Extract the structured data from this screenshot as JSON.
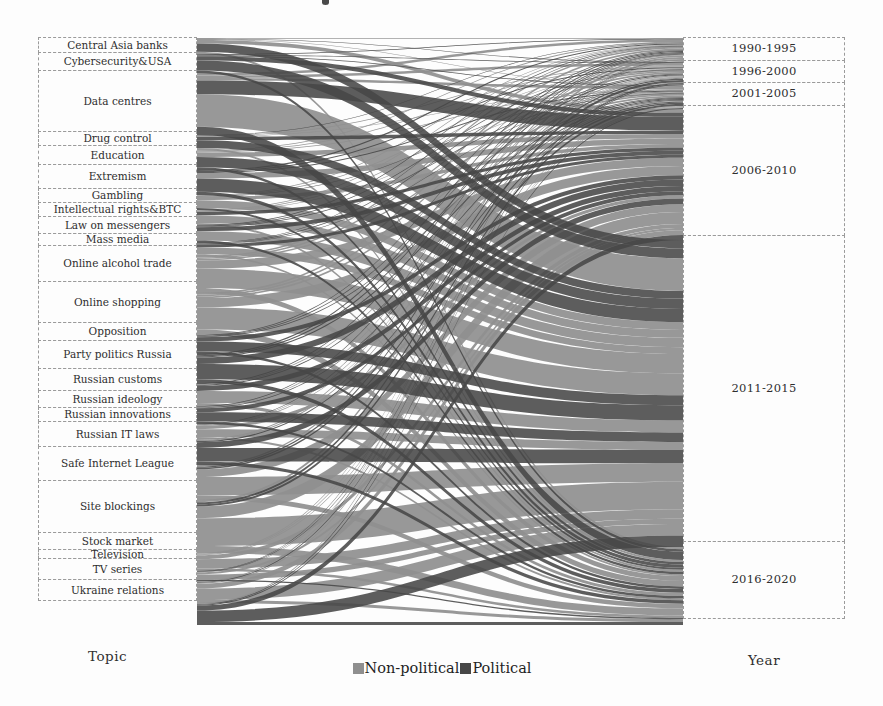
{
  "chart_data": {
    "type": "sankey",
    "left_axis_label": "Topic",
    "right_axis_label": "Year",
    "legend": [
      {
        "label": "Non-political",
        "color": "#8f8f8f"
      },
      {
        "label": "Political",
        "color": "#474747"
      }
    ],
    "left_nodes": [
      {
        "label": "Central Asia banks",
        "value": 16,
        "political_share": 0.35
      },
      {
        "label": "Cybersecurity&USA",
        "value": 19,
        "political_share": 0.7
      },
      {
        "label": "Data centres",
        "value": 62,
        "political_share": 0.25
      },
      {
        "label": "Drug control",
        "value": 15,
        "political_share": 0.5
      },
      {
        "label": "Education",
        "value": 20,
        "political_share": 0.2
      },
      {
        "label": "Extremism",
        "value": 25,
        "political_share": 0.8
      },
      {
        "label": "Gambling",
        "value": 15,
        "political_share": 0.4
      },
      {
        "label": "Intellectual rights&BTC",
        "value": 15,
        "political_share": 0.35
      },
      {
        "label": "Law on messengers",
        "value": 18,
        "political_share": 0.7
      },
      {
        "label": "Mass media",
        "value": 13,
        "political_share": 0.6
      },
      {
        "label": "Online alcohol trade",
        "value": 37,
        "political_share": 0.3
      },
      {
        "label": "Online shopping",
        "value": 42,
        "political_share": 0.15
      },
      {
        "label": "Opposition",
        "value": 19,
        "political_share": 0.9
      },
      {
        "label": "Party politics Russia",
        "value": 29,
        "political_share": 0.9
      },
      {
        "label": "Russian customs",
        "value": 23,
        "political_share": 0.4
      },
      {
        "label": "Russian ideology",
        "value": 18,
        "political_share": 0.8
      },
      {
        "label": "Russian innovations",
        "value": 15,
        "political_share": 0.3
      },
      {
        "label": "Russian IT laws",
        "value": 26,
        "political_share": 0.7
      },
      {
        "label": "Safe Internet League",
        "value": 35,
        "political_share": 0.6
      },
      {
        "label": "Site blockings",
        "value": 53,
        "political_share": 0.55
      },
      {
        "label": "Stock market",
        "value": 18,
        "political_share": 0.25
      },
      {
        "label": "Television",
        "value": 10,
        "political_share": 0.4
      },
      {
        "label": "TV series",
        "value": 22,
        "political_share": 0.1
      },
      {
        "label": "Ukraine relations",
        "value": 22,
        "political_share": 0.85
      }
    ],
    "right_nodes": [
      {
        "label": "1990-1995",
        "value": 24
      },
      {
        "label": "1996-2000",
        "value": 23
      },
      {
        "label": "2001-2005",
        "value": 24
      },
      {
        "label": "2006-2010",
        "value": 131
      },
      {
        "label": "2011-2015",
        "value": 307
      },
      {
        "label": "2016-2020",
        "value": 78
      }
    ]
  }
}
